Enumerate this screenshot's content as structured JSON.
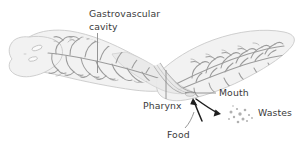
{
  "figure": {
    "background_color": "#ffffff",
    "body_fill": "#f0f0f0",
    "body_stroke": "#c8c8c8",
    "branch_color": "#9a9a9a",
    "leader_color": "#8a8a8a",
    "label_color": "#3a3a3a",
    "arrow_color": "#1e1e1e"
  },
  "labels": {
    "gastrovascular_line1": "Gastrovascular",
    "gastrovascular_line2": "cavity",
    "pharynx": "Pharynx",
    "mouth": "Mouth",
    "food": "Food",
    "wastes": "Wastes"
  },
  "structures": {
    "organism": "planarian-flatworm",
    "parts": [
      "gastrovascular-cavity",
      "pharynx",
      "mouth",
      "eyespots",
      "branched-gut-diverticula"
    ]
  },
  "flow": {
    "food_direction": "into-mouth",
    "wastes_direction": "out-of-mouth"
  }
}
